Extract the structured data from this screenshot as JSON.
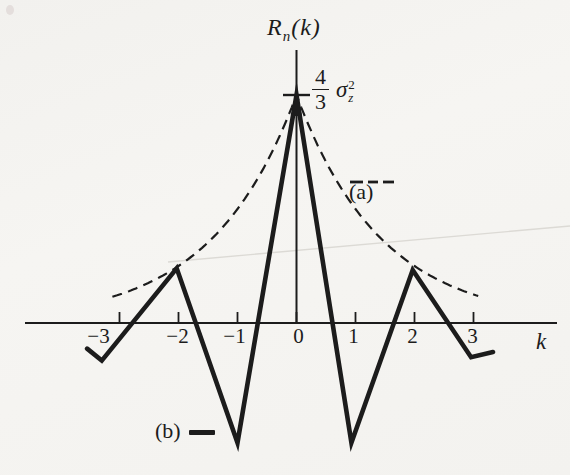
{
  "figure": {
    "title_parts": {
      "func": "R",
      "sub": "n",
      "arg": "(k)"
    },
    "peak_label": {
      "numerator": "4",
      "denominator": "3",
      "symbol": "σ",
      "sup": "2",
      "sub": "z"
    },
    "x_axis_label": "k",
    "legend": [
      {
        "id": "a",
        "label": "(a)",
        "line_style": "dashed"
      },
      {
        "id": "b",
        "label": "(b)",
        "line_style": "solid"
      }
    ]
  },
  "colors": {
    "ink": "#1c1c1c",
    "paper": "#f4f3f0",
    "scan_artifact": "#dcdad5"
  },
  "chart_data": {
    "type": "line",
    "xlabel": "k",
    "ylabel": "",
    "x_ticks": [
      -3,
      -2,
      -1,
      0,
      1,
      2,
      3
    ],
    "x_tick_labels": [
      "−3",
      "−2",
      "−1",
      "0",
      "1",
      "2",
      "3"
    ],
    "y_unit": "sigma_z^2",
    "peak_value": 1.3333,
    "peak_value_label": "(4/3)·σz²",
    "grid": false,
    "legend_position": "inline annotations",
    "axes": {
      "x_range_drawn": [
        -4.6,
        4.4
      ],
      "y_axis_top_value": 1.6
    },
    "series": [
      {
        "name": "(a)",
        "style": "dashed",
        "model": "(4/3)σz²·(1/2)^|k|, smooth exponential decay",
        "x": [
          -3,
          -2,
          -1,
          0,
          1,
          2,
          3
        ],
        "values": [
          0.1667,
          0.3333,
          0.6667,
          1.3333,
          0.6667,
          0.3333,
          0.1667
        ],
        "decay_ratio": 0.5,
        "k_range": [
          -3.12,
          3.08
        ]
      },
      {
        "name": "(b)",
        "style": "solid",
        "model": "(4/3)σz²·(−1/2)^|k|, straight segments between lags",
        "x": [
          -3,
          -2,
          -1,
          0,
          1,
          2,
          3
        ],
        "values": [
          -0.1667,
          0.3333,
          -0.6667,
          1.3333,
          -0.6667,
          0.3333,
          -0.1667
        ],
        "drawn_polyline": [
          [
            -3.55,
            -0.15
          ],
          [
            -3.3,
            -0.22
          ],
          [
            -2.03,
            0.32
          ],
          [
            -1.0,
            -0.7
          ],
          [
            0.0,
            1.3333
          ],
          [
            0.93,
            -0.7
          ],
          [
            1.97,
            0.31
          ],
          [
            2.96,
            -0.2
          ],
          [
            3.33,
            -0.17
          ]
        ]
      }
    ]
  }
}
